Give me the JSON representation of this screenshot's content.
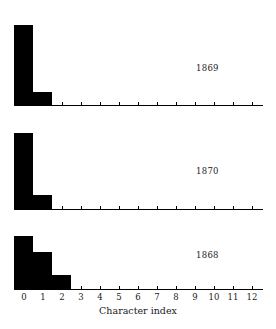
{
  "figure": {
    "xlabel": "Character index",
    "background_color": "#ffffff",
    "bar_color": "#000000",
    "axis_color": "#000000"
  },
  "axis": {
    "tick_labels": [
      "0",
      "1",
      "2",
      "3",
      "4",
      "5",
      "6",
      "7",
      "8",
      "9",
      "10",
      "11",
      "12"
    ],
    "xlim": [
      -0.5,
      12.5
    ],
    "grid": false
  },
  "panels": [
    {
      "year_label": "1869"
    },
    {
      "year_label": "1870"
    },
    {
      "year_label": "1868"
    }
  ],
  "chart_data": {
    "type": "bar",
    "title": "",
    "subtitle": "",
    "xlabel": "Character index",
    "ylabel": "",
    "xlim": [
      -0.5,
      12.5
    ],
    "ylim": [
      0,
      1
    ],
    "grid": false,
    "legend_position": "none",
    "layout": "3 stacked panels, shared x-axis, one histogram per year",
    "categories": [
      0,
      1,
      2,
      3,
      4,
      5,
      6,
      7,
      8,
      9,
      10,
      11,
      12
    ],
    "series": [
      {
        "name": "1869",
        "annotation": "1869",
        "panel": 0,
        "values": [
          0.88,
          0.14,
          0.0,
          0.0,
          0.0,
          0.0,
          0.0,
          0.0,
          0.0,
          0.0,
          0.0,
          0.0,
          0.0
        ]
      },
      {
        "name": "1870",
        "annotation": "1870",
        "panel": 1,
        "values": [
          0.9,
          0.17,
          0.0,
          0.0,
          0.0,
          0.0,
          0.0,
          0.0,
          0.0,
          0.0,
          0.0,
          0.0,
          0.0
        ]
      },
      {
        "name": "1868",
        "annotation": "1868",
        "panel": 2,
        "values": [
          0.85,
          0.6,
          0.22,
          0.0,
          0.0,
          0.0,
          0.0,
          0.0,
          0.0,
          0.0,
          0.0,
          0.0,
          0.0
        ]
      }
    ]
  }
}
